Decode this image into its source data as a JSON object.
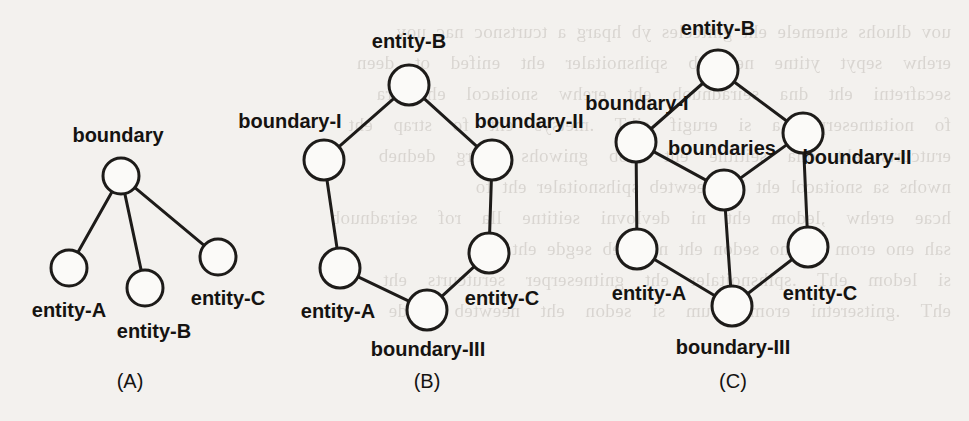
{
  "figure": {
    "background_color": "#f3f1ee",
    "ink_color": "#1d1b19",
    "node_fill": "#fbfaf8",
    "bleed_text": "uov dluohs stnemele eht gnitceles yb hparg a tcurtsnoc nac uoy\nerehw  sepyt  ytitne  neewteb  spihsnoitaler  eht  enifed  ot  deen\nsecafretni  eht  dna  seiradnuob  eht  erehw  snoitacol  eht  era\nfo  noitatneserper  a  si  erugif  sihT  .metsys  eht  fo  strap  eht\nerutcurts  eht  dna  seititne  eht  htob  gniwohs  hparg  dedneb\nnwohs sa snoitacol eht lla neewteb spihsnoitaler eht fo\nhcae  erehw  ,ledom  eht  ni  devlovni  seititne  lla  rof  seiradnuob\nsah eno erom ro eno sedon eht neewteb segde eht fo\nsi  ledom  ehT  .spihsnoitaler  eht  gnitneserper  serutcurts  eht\nehT  .gnitseretni  erom  hcum  si  sedon  eht  neewteb  segde\n"
  },
  "panels": [
    {
      "id": "A",
      "caption": "(A)",
      "caption_pos": {
        "x": 130,
        "y": 388
      },
      "node_radius": 18,
      "nodes": [
        {
          "id": "a-boundary",
          "label": "boundary",
          "cx": 121,
          "cy": 176,
          "label_x": 118,
          "label_y": 142,
          "anchor": "middle"
        },
        {
          "id": "a-entity-a",
          "label": "entity-A",
          "cx": 69,
          "cy": 268,
          "label_x": 69,
          "label_y": 317,
          "anchor": "middle"
        },
        {
          "id": "a-entity-b",
          "label": "entity-B",
          "cx": 145,
          "cy": 288,
          "label_x": 154,
          "label_y": 338,
          "anchor": "middle"
        },
        {
          "id": "a-entity-c",
          "label": "entity-C",
          "cx": 218,
          "cy": 257,
          "label_x": 228,
          "label_y": 305,
          "anchor": "middle"
        }
      ],
      "edges": [
        {
          "from": "a-boundary",
          "to": "a-entity-a"
        },
        {
          "from": "a-boundary",
          "to": "a-entity-b"
        },
        {
          "from": "a-boundary",
          "to": "a-entity-c"
        }
      ]
    },
    {
      "id": "B",
      "caption": "(B)",
      "caption_pos": {
        "x": 427,
        "y": 388
      },
      "node_radius": 20,
      "nodes": [
        {
          "id": "b-entity-b",
          "label": "entity-B",
          "cx": 409,
          "cy": 85,
          "label_x": 409,
          "label_y": 48,
          "anchor": "middle"
        },
        {
          "id": "b-boundary-i",
          "label": "boundary-I",
          "cx": 324,
          "cy": 160,
          "label_x": 290,
          "label_y": 128,
          "anchor": "middle"
        },
        {
          "id": "b-boundary-ii",
          "label": "boundary-II",
          "cx": 492,
          "cy": 160,
          "label_x": 529,
          "label_y": 128,
          "anchor": "middle"
        },
        {
          "id": "b-entity-a",
          "label": "entity-A",
          "cx": 340,
          "cy": 268,
          "label_x": 338,
          "label_y": 318,
          "anchor": "middle"
        },
        {
          "id": "b-entity-c",
          "label": "entity-C",
          "cx": 489,
          "cy": 253,
          "label_x": 502,
          "label_y": 305,
          "anchor": "middle"
        },
        {
          "id": "b-boundary-iii",
          "label": "boundary-III",
          "cx": 427,
          "cy": 310,
          "label_x": 428,
          "label_y": 356,
          "anchor": "middle"
        }
      ],
      "edges": [
        {
          "from": "b-entity-b",
          "to": "b-boundary-i"
        },
        {
          "from": "b-entity-b",
          "to": "b-boundary-ii"
        },
        {
          "from": "b-boundary-i",
          "to": "b-entity-a"
        },
        {
          "from": "b-boundary-ii",
          "to": "b-entity-c"
        },
        {
          "from": "b-entity-a",
          "to": "b-boundary-iii"
        },
        {
          "from": "b-entity-c",
          "to": "b-boundary-iii"
        }
      ]
    },
    {
      "id": "C",
      "caption": "(C)",
      "caption_pos": {
        "x": 733,
        "y": 388
      },
      "node_radius": 20,
      "nodes": [
        {
          "id": "c-entity-b",
          "label": "entity-B",
          "cx": 718,
          "cy": 70,
          "label_x": 718,
          "label_y": 35,
          "anchor": "middle"
        },
        {
          "id": "c-boundary-i",
          "label": "boundary-I",
          "cx": 636,
          "cy": 142,
          "label_x": 637,
          "label_y": 110,
          "anchor": "middle"
        },
        {
          "id": "c-boundary-ii",
          "label": "boundary-II",
          "cx": 803,
          "cy": 133,
          "label_x": 857,
          "label_y": 164,
          "anchor": "middle"
        },
        {
          "id": "c-boundaries",
          "label": "boundaries",
          "cx": 724,
          "cy": 190,
          "label_x": 722,
          "label_y": 155,
          "anchor": "middle"
        },
        {
          "id": "c-entity-a",
          "label": "entity-A",
          "cx": 637,
          "cy": 249,
          "label_x": 649,
          "label_y": 300,
          "anchor": "middle"
        },
        {
          "id": "c-entity-c",
          "label": "entity-C",
          "cx": 808,
          "cy": 247,
          "label_x": 820,
          "label_y": 300,
          "anchor": "middle"
        },
        {
          "id": "c-boundary-iii",
          "label": "boundary-III",
          "cx": 732,
          "cy": 306,
          "label_x": 733,
          "label_y": 354,
          "anchor": "middle"
        }
      ],
      "edges": [
        {
          "from": "c-entity-b",
          "to": "c-boundary-i"
        },
        {
          "from": "c-entity-b",
          "to": "c-boundary-ii"
        },
        {
          "from": "c-boundary-i",
          "to": "c-boundaries"
        },
        {
          "from": "c-boundary-ii",
          "to": "c-boundaries"
        },
        {
          "from": "c-boundary-i",
          "to": "c-entity-a"
        },
        {
          "from": "c-boundary-ii",
          "to": "c-entity-c"
        },
        {
          "from": "c-boundaries",
          "to": "c-boundary-iii"
        },
        {
          "from": "c-entity-a",
          "to": "c-boundary-iii"
        },
        {
          "from": "c-entity-c",
          "to": "c-boundary-iii"
        }
      ]
    }
  ]
}
